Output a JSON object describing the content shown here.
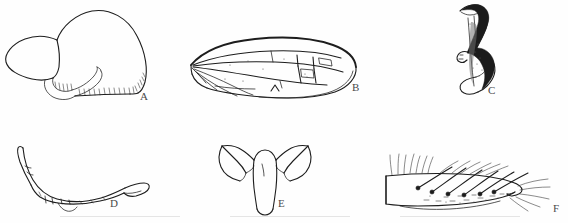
{
  "figure": {
    "caption_present": false,
    "background_color": "#fefefe",
    "ink_color": "#1d1d1d",
    "label_color": "#4a4a4a",
    "panel_count": 6,
    "panels": [
      {
        "id": "A",
        "label": "A",
        "subject": "head-capsule-lateral",
        "description": "Lateral view of head capsule with serrated ventral comb margin",
        "label_x": 140,
        "label_y": 98
      },
      {
        "id": "B",
        "label": "B",
        "subject": "wing-venation",
        "description": "Elongate wing with longitudinal veins and cells",
        "label_x": 352,
        "label_y": 88
      },
      {
        "id": "C",
        "label": "C",
        "subject": "hooked-sclerite",
        "description": "Hook-shaped sclerite with dark sclerotised margin",
        "label_x": 489,
        "label_y": 92
      },
      {
        "id": "D",
        "label": "D",
        "subject": "curved-appendage",
        "description": "Elongate curved appendage, tapering apex",
        "label_x": 110,
        "label_y": 204
      },
      {
        "id": "E",
        "label": "E",
        "subject": "anchor-sclerite",
        "description": "Anchor or T-shaped sclerite with paired lateral arms",
        "label_x": 278,
        "label_y": 203
      },
      {
        "id": "F",
        "label": "F",
        "subject": "leg-segment-setae",
        "description": "Leg segment bearing rows of stout setae and fine hairs",
        "label_x": 555,
        "label_y": 205
      }
    ]
  }
}
